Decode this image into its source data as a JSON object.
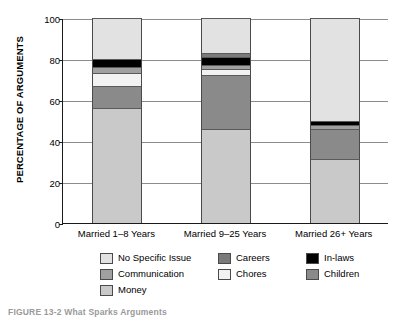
{
  "figure": {
    "caption_prefix": "FIGURE 13-2",
    "caption_text": "What Sparks Arguments"
  },
  "chart_data": {
    "type": "bar",
    "title": "",
    "subtitle": "",
    "xlabel": "",
    "ylabel": "PERCENTAGE OF ARGUMENTS",
    "ylim": [
      0,
      100
    ],
    "yticks": [
      0,
      20,
      40,
      60,
      80,
      100
    ],
    "grid": true,
    "stacked": true,
    "legend_position": "bottom",
    "categories": [
      "Married 1–8 Years",
      "Married 9–25 Years",
      "Married 26+ Years"
    ],
    "series": [
      {
        "name": "Money",
        "color": "#c9c9c9",
        "values": [
          56,
          46,
          31
        ]
      },
      {
        "name": "Children",
        "color": "#8a8a8a",
        "values": [
          11,
          26,
          15
        ]
      },
      {
        "name": "Chores",
        "color": "#f2f2f2",
        "values": [
          6,
          3,
          0
        ]
      },
      {
        "name": "Communication",
        "color": "#a0a0a0",
        "values": [
          3,
          2,
          2
        ]
      },
      {
        "name": "In-laws",
        "color": "#000000",
        "values": [
          4,
          4,
          2
        ]
      },
      {
        "name": "Careers",
        "color": "#7a7a7a",
        "values": [
          0,
          2,
          0
        ]
      },
      {
        "name": "No Specific Issue",
        "color": "#e2e2e2",
        "values": [
          20,
          17,
          50
        ]
      }
    ]
  },
  "legend": {
    "columns": [
      [
        {
          "label": "No Specific Issue",
          "color": "#e2e2e2"
        },
        {
          "label": "Communication",
          "color": "#a0a0a0"
        },
        {
          "label": "Money",
          "color": "#c9c9c9"
        }
      ],
      [
        {
          "label": "Careers",
          "color": "#7a7a7a"
        },
        {
          "label": "Chores",
          "color": "#f2f2f2"
        }
      ],
      [
        {
          "label": "In-laws",
          "color": "#000000"
        },
        {
          "label": "Children",
          "color": "#8a8a8a"
        }
      ]
    ]
  }
}
